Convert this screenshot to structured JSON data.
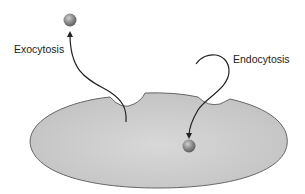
{
  "diagram": {
    "labels": {
      "exocytosis": "Exocytosis",
      "endocytosis": "Endocytosis"
    },
    "colors": {
      "cell_fill": "#c8c8c8",
      "cell_stroke": "#666666",
      "vesicle": "#8a8a8a",
      "arrow": "#222222",
      "background": "#ffffff"
    },
    "elements": {
      "cell": "cell-membrane-ellipse",
      "vesicle_outside": "released-vesicle",
      "vesicle_inside": "internalized-vesicle",
      "exocytosis_arrow": "arrow-out-of-cell",
      "endocytosis_arrow": "arrow-into-cell"
    }
  }
}
